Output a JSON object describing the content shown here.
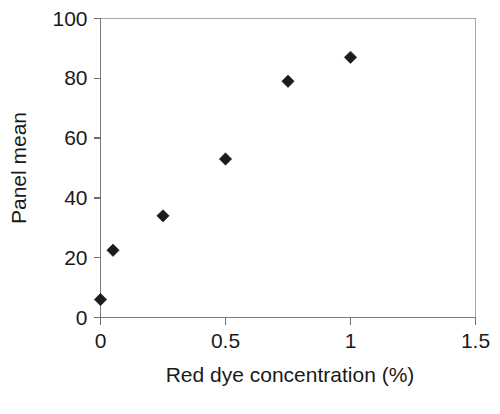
{
  "chart_data": {
    "type": "scatter",
    "title": "",
    "xlabel": "Red dye concentration (%)",
    "ylabel": "Panel mean",
    "xlim": [
      0,
      1.5
    ],
    "ylim": [
      0,
      100
    ],
    "xticks": [
      0,
      0.5,
      1,
      1.5
    ],
    "xtick_labels": [
      "0",
      "0.5",
      "1",
      "1.5"
    ],
    "yticks": [
      0,
      20,
      40,
      60,
      80,
      100
    ],
    "ytick_labels": [
      "0",
      "20",
      "40",
      "60",
      "80",
      "100"
    ],
    "grid": false,
    "legend": false,
    "marker": "diamond",
    "marker_color": "#1c1c1c",
    "series": [
      {
        "name": "Panel mean",
        "points": [
          {
            "x": 0,
            "y": 6
          },
          {
            "x": 0.05,
            "y": 22.5
          },
          {
            "x": 0.25,
            "y": 34
          },
          {
            "x": 0.5,
            "y": 53
          },
          {
            "x": 0.75,
            "y": 79
          },
          {
            "x": 1.0,
            "y": 87
          }
        ]
      }
    ]
  },
  "axis_titles": {
    "x": "Red dye concentration (%)",
    "y": "Panel mean"
  }
}
